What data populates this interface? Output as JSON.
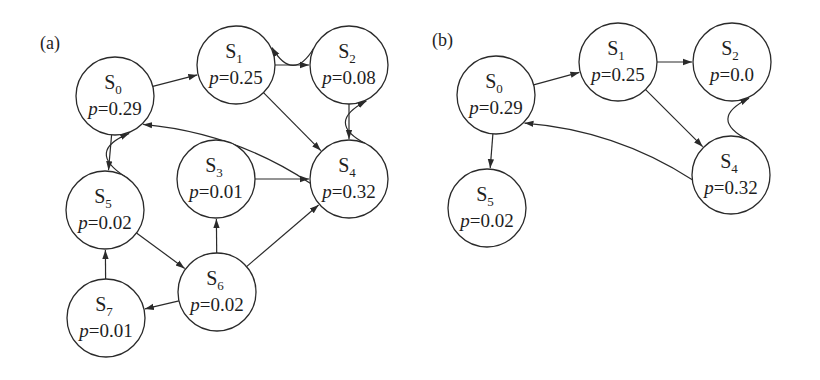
{
  "figure": {
    "panels": [
      {
        "id": "a",
        "label": "(a)",
        "label_pos": [
          40,
          49
        ],
        "nodes": [
          {
            "id": "S0",
            "name": "S",
            "sub": "0",
            "prob_var": "p",
            "prob_eq": "=",
            "prob_value": "0.29",
            "cx": 115,
            "cy": 96
          },
          {
            "id": "S1",
            "name": "S",
            "sub": "1",
            "prob_var": "p",
            "prob_eq": "=",
            "prob_value": "0.25",
            "cx": 236,
            "cy": 65
          },
          {
            "id": "S2",
            "name": "S",
            "sub": "2",
            "prob_var": "p",
            "prob_eq": "=",
            "prob_value": "0.08",
            "cx": 349,
            "cy": 65
          },
          {
            "id": "S3",
            "name": "S",
            "sub": "3",
            "prob_var": "p",
            "prob_eq": "=",
            "prob_value": "0.01",
            "cx": 216,
            "cy": 179
          },
          {
            "id": "S4",
            "name": "S",
            "sub": "4",
            "prob_var": "p",
            "prob_eq": "=",
            "prob_value": "0.32",
            "cx": 349,
            "cy": 179
          },
          {
            "id": "S5",
            "name": "S",
            "sub": "5",
            "prob_var": "p",
            "prob_eq": "=",
            "prob_value": "0.02",
            "cx": 105,
            "cy": 210
          },
          {
            "id": "S6",
            "name": "S",
            "sub": "6",
            "prob_var": "p",
            "prob_eq": "=",
            "prob_value": "0.02",
            "cx": 217,
            "cy": 292
          },
          {
            "id": "S7",
            "name": "S",
            "sub": "7",
            "prob_var": "p",
            "prob_eq": "=",
            "prob_value": "0.01",
            "cx": 106,
            "cy": 318
          }
        ],
        "edges": [
          {
            "from": "S0",
            "to": "S1",
            "curve": 0
          },
          {
            "from": "S1",
            "to": "S2",
            "curve": 0
          },
          {
            "from": "S2",
            "to": "S1",
            "curve": -22
          },
          {
            "from": "S1",
            "to": "S4",
            "curve": 0
          },
          {
            "from": "S2",
            "to": "S4",
            "curve": 0
          },
          {
            "from": "S4",
            "to": "S2",
            "curve": -26
          },
          {
            "from": "S4",
            "to": "S0",
            "curve": 14
          },
          {
            "from": "S3",
            "to": "S4",
            "curve": 0
          },
          {
            "from": "S0",
            "to": "S5",
            "curve": 0
          },
          {
            "from": "S5",
            "to": "S0",
            "curve": -26
          },
          {
            "from": "S5",
            "to": "S6",
            "curve": 0
          },
          {
            "from": "S6",
            "to": "S3",
            "curve": 0
          },
          {
            "from": "S6",
            "to": "S4",
            "curve": 0
          },
          {
            "from": "S6",
            "to": "S7",
            "curve": 0
          },
          {
            "from": "S7",
            "to": "S5",
            "curve": 0
          }
        ]
      },
      {
        "id": "b",
        "label": "(b)",
        "label_pos": [
          432,
          46
        ],
        "nodes": [
          {
            "id": "S0",
            "name": "S",
            "sub": "0",
            "prob_var": "p",
            "prob_eq": "=",
            "prob_value": "0.29",
            "cx": 496,
            "cy": 95
          },
          {
            "id": "S1",
            "name": "S",
            "sub": "1",
            "prob_var": "p",
            "prob_eq": "=",
            "prob_value": "0.25",
            "cx": 618,
            "cy": 62
          },
          {
            "id": "S2",
            "name": "S",
            "sub": "2",
            "prob_var": "p",
            "prob_eq": "=",
            "prob_value": "0.0",
            "cx": 732,
            "cy": 62
          },
          {
            "id": "S4",
            "name": "S",
            "sub": "4",
            "prob_var": "p",
            "prob_eq": "=",
            "prob_value": "0.32",
            "cx": 731,
            "cy": 175
          },
          {
            "id": "S5",
            "name": "S",
            "sub": "5",
            "prob_var": "p",
            "prob_eq": "=",
            "prob_value": "0.02",
            "cx": 487,
            "cy": 208
          }
        ],
        "edges": [
          {
            "from": "S0",
            "to": "S1",
            "curve": 0
          },
          {
            "from": "S1",
            "to": "S2",
            "curve": 0
          },
          {
            "from": "S1",
            "to": "S4",
            "curve": 0
          },
          {
            "from": "S4",
            "to": "S0",
            "curve": 14
          },
          {
            "from": "S4",
            "to": "S2",
            "curve": -26
          },
          {
            "from": "S0",
            "to": "S5",
            "curve": 0
          }
        ]
      }
    ],
    "node_radius": 39,
    "stroke_color": "#2a2a2a",
    "background": "#ffffff"
  }
}
